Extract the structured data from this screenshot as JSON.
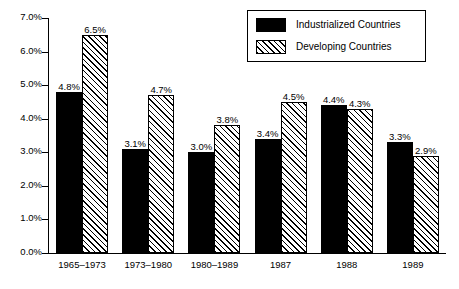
{
  "chart_data": {
    "type": "bar",
    "title": "",
    "subtitle": "",
    "xlabel": "",
    "ylabel": "",
    "ylim": [
      0,
      7
    ],
    "ytick_labels": [
      "0.0%",
      "1.0%",
      "2.0%",
      "3.0%",
      "4.0%",
      "5.0%",
      "6.0%",
      "7.0%"
    ],
    "ytick_values": [
      0,
      1,
      2,
      3,
      4,
      5,
      6,
      7
    ],
    "grid": false,
    "legend_position": "top-right",
    "categories": [
      "1965–1973",
      "1973–1980",
      "1980–1989",
      "1987",
      "1988",
      "1989"
    ],
    "series": [
      {
        "name": "Industrialized Countries",
        "fill": "solid-black",
        "values": [
          4.8,
          3.1,
          3.0,
          3.4,
          4.4,
          3.3
        ],
        "labels": [
          "4.8%",
          "3.1%",
          "3.0%",
          "3.4%",
          "4.4%",
          "3.3%"
        ]
      },
      {
        "name": "Developing Countries",
        "fill": "diagonal-hatch",
        "values": [
          6.5,
          4.7,
          3.8,
          4.5,
          4.3,
          2.9
        ],
        "labels": [
          "6.5%",
          "4.7%",
          "3.8%",
          "4.5%",
          "4.3%",
          "2.9%"
        ]
      }
    ]
  },
  "legend": {
    "items": [
      {
        "label": "Industrialized Countries",
        "fill": "solid-black"
      },
      {
        "label": "Developing Countries",
        "fill": "diagonal-hatch"
      }
    ]
  },
  "colors": {
    "axis": "#000000",
    "series_industrialized": "#000000",
    "series_developing": "#ffffff",
    "background": "#ffffff"
  }
}
